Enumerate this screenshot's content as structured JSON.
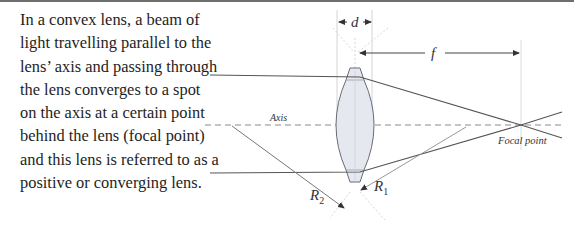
{
  "description": {
    "text": "In a convex lens, a beam of light travelling parallel to the lens’ axis and passing through the lens converges to a spot on the axis at a certain point behind the lens (focal point) and this lens is referred to as a positive or converging lens."
  },
  "diagram": {
    "labels": {
      "thickness": "d",
      "focal_length": "f",
      "axis": "Axis",
      "focal_point": "Focal point",
      "radius2": "R",
      "radius2_sub": "2",
      "radius1": "R",
      "radius1_sub": "1"
    },
    "colors": {
      "line": "#555555",
      "lens_fill": "#e6e8f0",
      "guide": "#cccccc"
    }
  }
}
